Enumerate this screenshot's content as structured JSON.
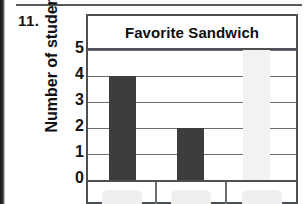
{
  "page": {
    "problem_number": "11.",
    "scan_left_edge": "scan-edge-artifact",
    "scan_top_rule": "horizontal-rule"
  },
  "chart_data": {
    "type": "bar",
    "title": "Favorite Sandwich",
    "xlabel": "",
    "ylabel": "Number of students",
    "categories": [
      "",
      "",
      ""
    ],
    "values": [
      4,
      2,
      0
    ],
    "ylim": [
      0,
      5
    ],
    "ytick_labels": [
      "5",
      "4",
      "3",
      "2",
      "1",
      "0"
    ],
    "ytick_values": [
      5,
      4,
      3,
      2,
      1,
      0
    ],
    "grid": true,
    "legend": "none",
    "bar_color": "#3d3d3d",
    "frame_color": "#4c5054",
    "grid_color": "#6b7074",
    "background": "#ffffff",
    "note_categories_cropped": "category labels cropped at bottom edge"
  }
}
